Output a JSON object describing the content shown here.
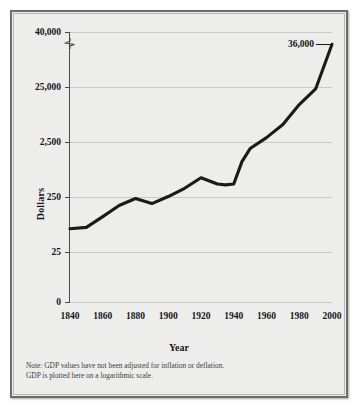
{
  "figure": {
    "note_line_1": "Note: GDP values have not been adjusted for inflation or deflation.",
    "note_line_2": "GDP is plotted here on a logarithmic scale."
  },
  "chart_data": {
    "type": "line",
    "title": "",
    "xlabel": "Year",
    "ylabel": "Dollars",
    "scale": "logarithmic",
    "grid": true,
    "legend": null,
    "axis_break": "below 40,000 tick",
    "xlim": [
      1840,
      2000
    ],
    "x_ticks": [
      1840,
      1860,
      1880,
      1900,
      1920,
      1940,
      1960,
      1980,
      2000
    ],
    "x_tick_labels": [
      "1840",
      "1860",
      "1880",
      "1900",
      "1920",
      "1940",
      "1960",
      "1980",
      "2000"
    ],
    "y_ticks": [
      0,
      25,
      250,
      2500,
      25000,
      40000
    ],
    "y_tick_labels": [
      "0",
      "25",
      "250",
      "2,500",
      "25,000",
      "40,000"
    ],
    "annotations": [
      {
        "label": "36,000",
        "x": 2000,
        "y": 36000
      }
    ],
    "series": [
      {
        "name": "GDP per capita",
        "color": "#1a1a1a",
        "x": [
          1840,
          1850,
          1860,
          1870,
          1880,
          1890,
          1900,
          1910,
          1920,
          1930,
          1935,
          1940,
          1945,
          1950,
          1960,
          1970,
          1980,
          1990,
          2000
        ],
        "values": [
          66,
          70,
          110,
          175,
          235,
          190,
          255,
          360,
          560,
          430,
          415,
          430,
          1100,
          1900,
          3000,
          5200,
          12000,
          23000,
          36000
        ]
      }
    ]
  }
}
